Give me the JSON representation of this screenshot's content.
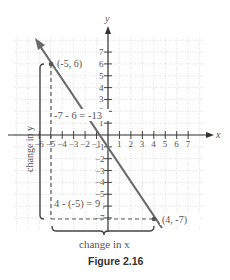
{
  "figure": {
    "caption": "Figure 2.16",
    "x_axis_label": "x",
    "y_axis_label": "y",
    "x_ticks": [
      "-6",
      "-5",
      "-4",
      "-3",
      "-2",
      "-1",
      "1",
      "2",
      "3",
      "4",
      "5",
      "6",
      "7"
    ],
    "y_ticks": [
      "7",
      "6",
      "5",
      "4",
      "3",
      "2",
      "1",
      "-1",
      "-2",
      "-3",
      "-4",
      "-5",
      "-6",
      "-7"
    ],
    "point_a_label": "(-5, 6)",
    "point_b_label": "(4, -7)",
    "rise_expression": "-7 - 6 = -13",
    "run_expression": "4 - (-5) = 9",
    "change_in_y_label": "change in y",
    "change_in_x_label": "change in x"
  },
  "chart_data": {
    "type": "line",
    "title": "Figure 2.16",
    "xlabel": "x",
    "ylabel": "y",
    "xlim": [
      -7,
      8
    ],
    "ylim": [
      -8,
      8
    ],
    "grid": true,
    "points": [
      {
        "x": -5,
        "y": 6,
        "label": "(-5, 6)"
      },
      {
        "x": 4,
        "y": -7,
        "label": "(4, -7)"
      }
    ],
    "annotations": [
      "-7 - 6 = -13",
      "4 - (-5) = 9",
      "change in y",
      "change in x"
    ],
    "slope": "-13/9"
  }
}
